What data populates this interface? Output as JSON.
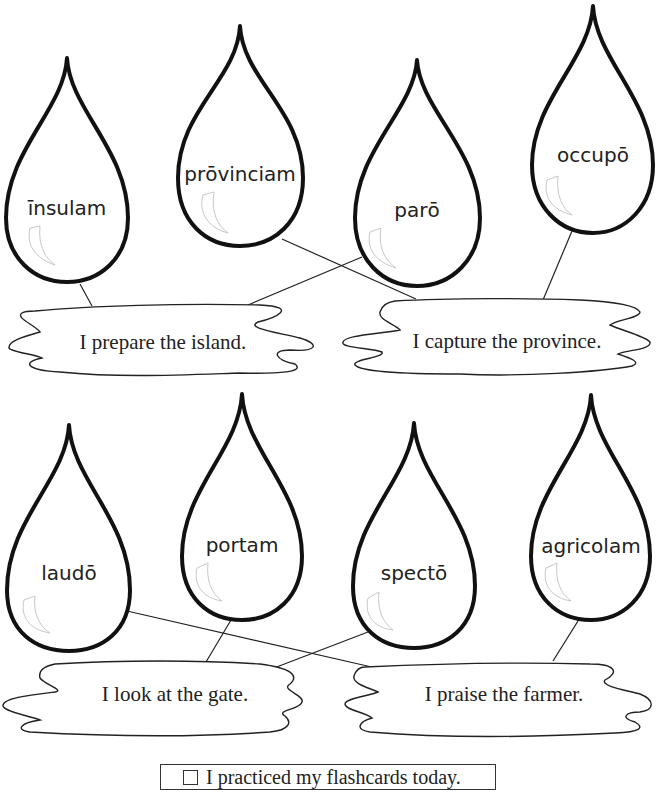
{
  "drops": [
    {
      "word": "īnsulam"
    },
    {
      "word": "prōvinciam"
    },
    {
      "word": "parō"
    },
    {
      "word": "occupō"
    },
    {
      "word": "laudō"
    },
    {
      "word": "portam"
    },
    {
      "word": "spectō"
    },
    {
      "word": "agricolam"
    }
  ],
  "sentences": [
    {
      "text": "I prepare the island."
    },
    {
      "text": "I capture the province."
    },
    {
      "text": "I look at the gate."
    },
    {
      "text": "I praise the farmer."
    }
  ],
  "footer": {
    "checkbox_checked": false,
    "label": "I practiced my flashcards today."
  },
  "colors": {
    "line": "#222222",
    "background": "#ffffff"
  }
}
